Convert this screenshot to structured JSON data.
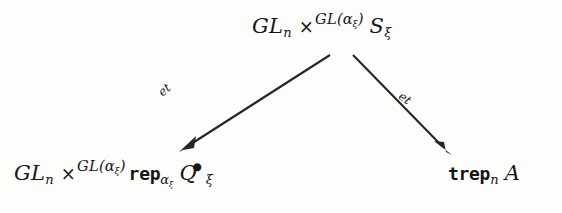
{
  "diagram": {
    "type": "commutative-diagram",
    "shape": "triangle-fork",
    "background_color": "#fdfdfb",
    "ink_color": "#262626",
    "nodes": [
      {
        "id": "top",
        "position": "top-center",
        "latex": "GL_n \\times^{GL(\\alpha_\\xi)} S_\\xi",
        "plain": "GL_n x^{GL(alpha_xi)} S_xi",
        "parts": {
          "base": "GL",
          "base_sub": "n",
          "operator": "×",
          "superscript_base": "GL(",
          "superscript_alpha": "α",
          "superscript_alpha_sub": "ξ",
          "superscript_close": ")",
          "target": "S",
          "target_sub": "ξ"
        }
      },
      {
        "id": "bottom-left",
        "position": "bottom-left",
        "latex": "GL_n \\times^{GL(\\alpha_\\xi)} \\mathtt{rep}_{\\alpha_\\xi} Q^{\\bullet}_{\\xi}",
        "plain": "GL_n x^{GL(alpha_xi)} rep_{alpha_xi} Q^bullet_xi",
        "parts": {
          "base": "GL",
          "base_sub": "n",
          "operator": "×",
          "superscript_base": "GL(",
          "superscript_alpha": "α",
          "superscript_alpha_sub": "ξ",
          "superscript_close": ")",
          "functor": "rep",
          "functor_sub_alpha": "α",
          "functor_sub_xi": "ξ",
          "target": "Q",
          "target_sup": "•",
          "target_sub": "ξ"
        }
      },
      {
        "id": "bottom-right",
        "position": "bottom-right",
        "latex": "\\mathtt{trep}_n A",
        "plain": "trep_n A",
        "parts": {
          "functor": "trep",
          "functor_sub": "n",
          "target": "A"
        }
      }
    ],
    "edges": [
      {
        "id": "left-arrow",
        "from": "top",
        "to": "bottom-left",
        "label": "et",
        "label_style": "italic",
        "direction": "down-left",
        "head": "solid-triangle"
      },
      {
        "id": "right-arrow",
        "from": "top",
        "to": "bottom-right",
        "label": "et",
        "label_style": "italic",
        "direction": "down-right",
        "head": "solid-triangle"
      }
    ]
  }
}
